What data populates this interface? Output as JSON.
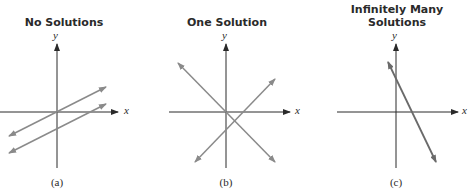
{
  "panels": [
    {
      "id": "a",
      "title": "No Solutions",
      "caption": "(a)",
      "x_label": "x",
      "y_label": "y",
      "description": "Two parallel lines that never intersect"
    },
    {
      "id": "b",
      "title": "One Solution",
      "caption": "(b)",
      "x_label": "x",
      "y_label": "y",
      "description": "Two lines intersecting at a single point"
    },
    {
      "id": "c",
      "title_line1": "Infinitely Many",
      "title_line2": "Solutions",
      "caption": "(c)",
      "x_label": "x",
      "y_label": "y",
      "description": "Two coincident lines (same line)"
    }
  ],
  "colors": {
    "axis": "#2a2a2a",
    "line": "#8a8a8a",
    "line_coincident": "#6a6a6a"
  }
}
